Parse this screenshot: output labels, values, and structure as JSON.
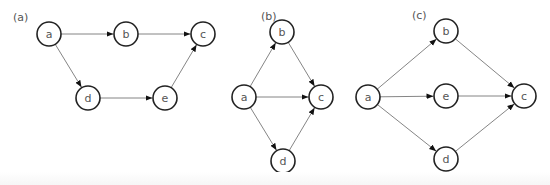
{
  "node_radius": 12,
  "colors": {
    "node_stroke": "#222222",
    "node_fill": "#ffffff",
    "edge": "#777777",
    "label_text": "#555555"
  },
  "panels": [
    {
      "id": "a",
      "label": "(a)",
      "label_pos": [
        13,
        21
      ],
      "nodes": [
        {
          "id": "a",
          "label": "a",
          "x": 49,
          "y": 34
        },
        {
          "id": "b",
          "label": "b",
          "x": 126,
          "y": 34
        },
        {
          "id": "c",
          "label": "c",
          "x": 203,
          "y": 34
        },
        {
          "id": "d",
          "label": "d",
          "x": 88,
          "y": 98
        },
        {
          "id": "e",
          "label": "e",
          "x": 165,
          "y": 98
        }
      ],
      "edges": [
        {
          "from": "a",
          "to": "b"
        },
        {
          "from": "b",
          "to": "c"
        },
        {
          "from": "a",
          "to": "d"
        },
        {
          "from": "d",
          "to": "e"
        },
        {
          "from": "e",
          "to": "c"
        }
      ]
    },
    {
      "id": "b",
      "label": "(b)",
      "label_pos": [
        261,
        20
      ],
      "nodes": [
        {
          "id": "b",
          "label": "b",
          "x": 282,
          "y": 32
        },
        {
          "id": "a",
          "label": "a",
          "x": 244,
          "y": 97
        },
        {
          "id": "c",
          "label": "c",
          "x": 321,
          "y": 97
        },
        {
          "id": "d",
          "label": "d",
          "x": 283,
          "y": 161
        }
      ],
      "edges": [
        {
          "from": "a",
          "to": "b"
        },
        {
          "from": "a",
          "to": "c"
        },
        {
          "from": "a",
          "to": "d"
        },
        {
          "from": "b",
          "to": "c"
        },
        {
          "from": "d",
          "to": "c"
        }
      ]
    },
    {
      "id": "c",
      "label": "(c)",
      "label_pos": [
        412,
        19
      ],
      "nodes": [
        {
          "id": "b",
          "label": "b",
          "x": 446,
          "y": 31
        },
        {
          "id": "a",
          "label": "a",
          "x": 368,
          "y": 97
        },
        {
          "id": "e",
          "label": "e",
          "x": 446,
          "y": 96
        },
        {
          "id": "c",
          "label": "c",
          "x": 524,
          "y": 96
        },
        {
          "id": "d",
          "label": "d",
          "x": 446,
          "y": 159
        }
      ],
      "edges": [
        {
          "from": "a",
          "to": "b"
        },
        {
          "from": "a",
          "to": "e"
        },
        {
          "from": "a",
          "to": "d"
        },
        {
          "from": "b",
          "to": "c"
        },
        {
          "from": "e",
          "to": "c"
        },
        {
          "from": "d",
          "to": "c"
        }
      ]
    }
  ]
}
